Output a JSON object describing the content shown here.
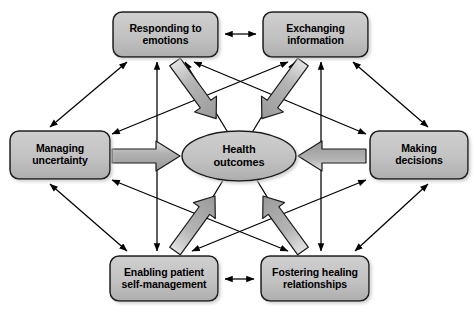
{
  "diagram": {
    "type": "conceptual-model",
    "title_visible": false,
    "background_color": "#ffffff",
    "node_fill_color": "#bfbfbf",
    "node_stroke_color": "#1a1a1a",
    "thick_arrow_fill_color": "#a8a8a8",
    "thick_arrow_stroke_color": "#1a1a1a",
    "thin_arrow_color": "#000000",
    "center": {
      "id": "health-outcomes",
      "label": "Health\noutcomes",
      "shape": "ellipse",
      "cx": 239,
      "cy": 156,
      "rx": 57,
      "ry": 25
    },
    "nodes": [
      {
        "id": "responding-to-emotions",
        "label": "Responding to\nemotions",
        "position": "top-left",
        "x": 113,
        "y": 12,
        "width": 105,
        "height": 45
      },
      {
        "id": "exchanging-information",
        "label": "Exchanging\ninformation",
        "position": "top-right",
        "x": 263,
        "y": 12,
        "width": 105,
        "height": 45
      },
      {
        "id": "managing-uncertainty",
        "label": "Managing\nuncertainty",
        "position": "left",
        "x": 10,
        "y": 131,
        "width": 100,
        "height": 48
      },
      {
        "id": "making-decisions",
        "label": "Making\ndecisions",
        "position": "right",
        "x": 370,
        "y": 131,
        "width": 98,
        "height": 48
      },
      {
        "id": "enabling-patient-self-management",
        "label": "Enabling patient\nself-management",
        "position": "bottom-left",
        "x": 110,
        "y": 256,
        "width": 108,
        "height": 45
      },
      {
        "id": "fostering-healing-relationships",
        "label": "Fostering healing\nrelationships",
        "position": "bottom-right",
        "x": 261,
        "y": 256,
        "width": 108,
        "height": 45
      }
    ],
    "thick_arrows": [
      {
        "id": "arrow-responding-to-center",
        "from": "responding-to-emotions",
        "to": "health-outcomes",
        "direction": "inward",
        "style": "thick-block"
      },
      {
        "id": "arrow-exchanging-to-center",
        "from": "exchanging-information",
        "to": "health-outcomes",
        "direction": "inward",
        "style": "thick-block"
      },
      {
        "id": "arrow-managing-to-center",
        "from": "managing-uncertainty",
        "to": "health-outcomes",
        "direction": "inward",
        "style": "thick-block"
      },
      {
        "id": "arrow-making-to-center",
        "from": "making-decisions",
        "to": "health-outcomes",
        "direction": "inward",
        "style": "thick-block"
      },
      {
        "id": "arrow-enabling-to-center",
        "from": "enabling-patient-self-management",
        "to": "health-outcomes",
        "direction": "inward",
        "style": "thick-block"
      },
      {
        "id": "arrow-fostering-to-center",
        "from": "fostering-healing-relationships",
        "to": "health-outcomes",
        "direction": "inward",
        "style": "thick-block"
      }
    ],
    "thin_arrows": [
      {
        "id": "link-responding-exchanging",
        "from": "responding-to-emotions",
        "to": "exchanging-information",
        "style": "double-headed"
      },
      {
        "id": "link-enabling-fostering",
        "from": "enabling-patient-self-management",
        "to": "fostering-healing-relationships",
        "style": "double-headed"
      },
      {
        "id": "link-responding-managing",
        "from": "responding-to-emotions",
        "to": "managing-uncertainty",
        "style": "double-headed"
      },
      {
        "id": "link-exchanging-making",
        "from": "exchanging-information",
        "to": "making-decisions",
        "style": "double-headed"
      },
      {
        "id": "link-managing-enabling",
        "from": "managing-uncertainty",
        "to": "enabling-patient-self-management",
        "style": "double-headed"
      },
      {
        "id": "link-making-fostering",
        "from": "making-decisions",
        "to": "fostering-healing-relationships",
        "style": "double-headed"
      },
      {
        "id": "link-responding-enabling",
        "from": "responding-to-emotions",
        "to": "enabling-patient-self-management",
        "style": "double-headed"
      },
      {
        "id": "link-exchanging-fostering",
        "from": "exchanging-information",
        "to": "fostering-healing-relationships",
        "style": "double-headed"
      },
      {
        "id": "link-responding-fostering",
        "from": "responding-to-emotions",
        "to": "fostering-healing-relationships",
        "style": "double-headed"
      },
      {
        "id": "link-exchanging-enabling",
        "from": "exchanging-information",
        "to": "enabling-patient-self-management",
        "style": "double-headed"
      },
      {
        "id": "link-managing-exchanging",
        "from": "managing-uncertainty",
        "to": "exchanging-information",
        "style": "double-headed"
      },
      {
        "id": "link-making-responding",
        "from": "making-decisions",
        "to": "responding-to-emotions",
        "style": "double-headed"
      },
      {
        "id": "link-managing-fostering",
        "from": "managing-uncertainty",
        "to": "fostering-healing-relationships",
        "style": "double-headed"
      },
      {
        "id": "link-making-enabling",
        "from": "making-decisions",
        "to": "enabling-patient-self-management",
        "style": "double-headed"
      },
      {
        "id": "link-managing-center-return",
        "from": "health-outcomes",
        "to": "managing-uncertainty",
        "style": "single-headed"
      },
      {
        "id": "link-making-center-return",
        "from": "health-outcomes",
        "to": "making-decisions",
        "style": "single-headed"
      }
    ]
  }
}
